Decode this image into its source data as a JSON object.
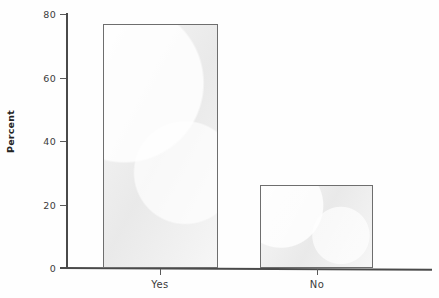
{
  "chart_data": {
    "type": "bar",
    "title": "",
    "xlabel": "",
    "ylabel": "Percent",
    "categories": [
      "Yes",
      "No"
    ],
    "values": [
      77,
      26
    ],
    "ylim": [
      0,
      80
    ],
    "yticks": [
      0,
      20,
      40,
      60,
      80
    ],
    "ytick_labels": [
      "0",
      "20",
      "40",
      "60",
      "80"
    ],
    "grid": false,
    "legend": false,
    "bar_fill_color": "#ededed",
    "bar_border_color": "#6e6e6e",
    "axis_color": "#4a4a4a",
    "background_color": "#ffffff"
  }
}
